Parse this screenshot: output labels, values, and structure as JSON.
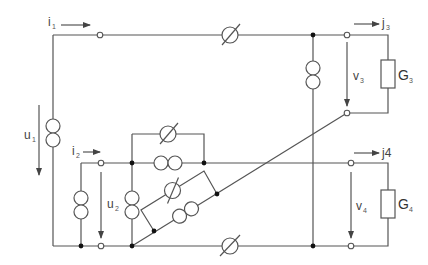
{
  "diagram": {
    "type": "electrical-circuit",
    "labels": {
      "i1": {
        "base": "i",
        "sub": "1"
      },
      "i2": {
        "base": "i",
        "sub": "2"
      },
      "j3": {
        "base": "j",
        "sub": "3"
      },
      "j4": {
        "base": "j4",
        "sub": ""
      },
      "u1": {
        "base": "u",
        "sub": "1"
      },
      "u2": {
        "base": "u",
        "sub": "2"
      },
      "v3": {
        "base": "v",
        "sub": "3"
      },
      "v4": {
        "base": "v",
        "sub": "4"
      },
      "G3": {
        "base": "G",
        "sub": "3"
      },
      "G4": {
        "base": "G",
        "sub": "4"
      }
    },
    "components": [
      {
        "id": "source-left",
        "kind": "current-source"
      },
      {
        "id": "source-inner-left",
        "kind": "current-source"
      },
      {
        "id": "source-center-vertical",
        "kind": "current-source"
      },
      {
        "id": "source-center-horizontal",
        "kind": "current-source"
      },
      {
        "id": "source-diagonal",
        "kind": "current-source"
      },
      {
        "id": "source-right-vertical",
        "kind": "current-source"
      },
      {
        "id": "meter-top",
        "kind": "variable-element"
      },
      {
        "id": "meter-bridge",
        "kind": "variable-element"
      },
      {
        "id": "meter-diagonal",
        "kind": "variable-element"
      },
      {
        "id": "meter-bottom",
        "kind": "variable-element"
      },
      {
        "id": "G3",
        "kind": "conductance"
      },
      {
        "id": "G4",
        "kind": "conductance"
      }
    ],
    "colors": {
      "wire": "#555555",
      "node": "#111111",
      "background": "#ffffff"
    }
  }
}
